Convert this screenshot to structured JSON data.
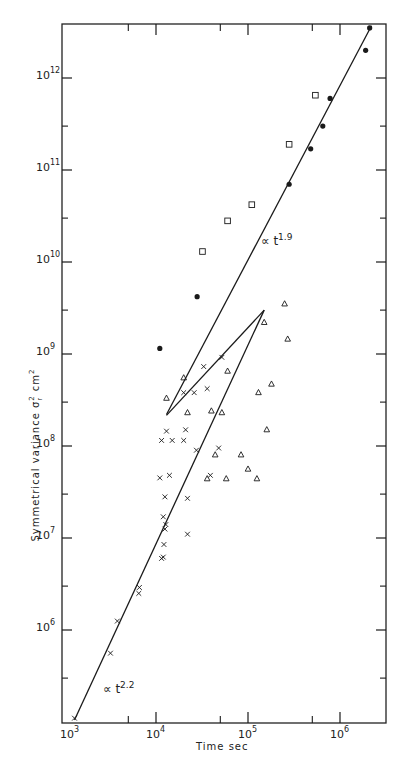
{
  "chart_data": {
    "type": "scatter",
    "scale": {
      "x": "log",
      "y": "log"
    },
    "title": "",
    "xlabel": "Time  sec",
    "ylabel": "Symmetrical  variance  σr² cm²",
    "ylabel_parts": {
      "text": "Symmetrical  variance  σ",
      "sub": "r",
      "sup": "2",
      "unit": " cm",
      "unit_sup": "2"
    },
    "xlim": [
      1000,
      3200000
    ],
    "ylim": [
      100000,
      3900000000000
    ],
    "grid": false,
    "legend": null,
    "x_ticks": [
      {
        "value": 1000,
        "label_base": "10",
        "label_exp": "3"
      },
      {
        "value": 10000,
        "label_base": "10",
        "label_exp": "4"
      },
      {
        "value": 100000,
        "label_base": "10",
        "label_exp": "5"
      },
      {
        "value": 1000000,
        "label_base": "10",
        "label_exp": "6"
      }
    ],
    "x_minor_ticks": [
      5000,
      50000,
      500000
    ],
    "y_ticks": [
      {
        "value": 1000000,
        "label_base": "10",
        "label_exp": "6"
      },
      {
        "value": 10000000,
        "label_base": "10",
        "label_exp": "7"
      },
      {
        "value": 100000000,
        "label_base": "10",
        "label_exp": "8"
      },
      {
        "value": 1000000000,
        "label_base": "10",
        "label_exp": "9"
      },
      {
        "value": 10000000000,
        "label_base": "10",
        "label_exp": "10"
      },
      {
        "value": 100000000000,
        "label_base": "10",
        "label_exp": "11"
      },
      {
        "value": 1000000000000,
        "label_base": "10",
        "label_exp": "12"
      }
    ],
    "y_minor_ticks": [
      300000,
      3000000,
      30000000,
      300000000,
      3000000000,
      30000000000,
      300000000000
    ],
    "series": [
      {
        "name": "filled circles",
        "marker": "filled-circle",
        "points": [
          [
            11000,
            1150000000
          ],
          [
            28000,
            4200000000
          ],
          [
            280000,
            70000000000
          ],
          [
            480000,
            170000000000
          ],
          [
            650000,
            300000000000
          ],
          [
            780000,
            600000000000
          ],
          [
            1900000,
            2000000000000
          ],
          [
            2100000,
            3500000000000
          ]
        ]
      },
      {
        "name": "open squares",
        "marker": "open-square",
        "points": [
          [
            32000,
            13000000000
          ],
          [
            60000,
            28000000000
          ],
          [
            110000,
            42000000000
          ],
          [
            280000,
            190000000000
          ],
          [
            540000,
            650000000000
          ]
        ]
      },
      {
        "name": "triangles",
        "marker": "open-triangle",
        "points": [
          [
            13000,
            330000000
          ],
          [
            20000,
            550000000
          ],
          [
            40000,
            240000000
          ],
          [
            60000,
            650000000
          ],
          [
            44000,
            80000000
          ],
          [
            36000,
            44000000
          ],
          [
            58000,
            44000000
          ],
          [
            84000,
            80000000
          ],
          [
            100000,
            56000000
          ],
          [
            125000,
            44000000
          ],
          [
            160000,
            150000000
          ],
          [
            130000,
            380000000
          ],
          [
            180000,
            470000000
          ],
          [
            150000,
            2200000000
          ],
          [
            250000,
            3500000000
          ],
          [
            270000,
            1450000000
          ],
          [
            22000,
            230000000
          ],
          [
            52000,
            230000000
          ]
        ]
      },
      {
        "name": "crosses",
        "marker": "cross",
        "points": [
          [
            1300,
            110000
          ],
          [
            3200,
            560000
          ],
          [
            3800,
            1250000
          ],
          [
            6500,
            2500000
          ],
          [
            6600,
            2900000
          ],
          [
            11500,
            6000000
          ],
          [
            12000,
            6200000
          ],
          [
            12200,
            8500000
          ],
          [
            12500,
            12500000
          ],
          [
            12800,
            14000000
          ],
          [
            12000,
            17000000
          ],
          [
            22000,
            11000000
          ],
          [
            11000,
            45000000
          ],
          [
            14000,
            48000000
          ],
          [
            12500,
            28000000
          ],
          [
            22000,
            27000000
          ],
          [
            11500,
            115000000
          ],
          [
            13000,
            145000000
          ],
          [
            15000,
            115000000
          ],
          [
            20000,
            115000000
          ],
          [
            21000,
            150000000
          ],
          [
            26000,
            380000000
          ],
          [
            20000,
            380000000
          ],
          [
            33000,
            730000000
          ],
          [
            36000,
            420000000
          ],
          [
            27500,
            90000000
          ],
          [
            48000,
            95000000
          ],
          [
            39000,
            48000000
          ],
          [
            52000,
            920000000
          ]
        ]
      }
    ],
    "fit_lines": [
      {
        "label_prefix": "∝ t",
        "exponent": "1.9",
        "from": [
          13000,
          220000000
        ],
        "to": [
          2200000,
          3700000000000
        ],
        "label_pos": [
          150000,
          17000000000
        ]
      },
      {
        "label_prefix": "∝ t",
        "exponent": "2.2",
        "from": [
          1300,
          105000
        ],
        "to": [
          150000,
          3000000000
        ],
        "label_pos": [
          1800,
          240000
        ]
      },
      {
        "label_prefix": "",
        "exponent": "",
        "from": [
          13000,
          215000000
        ],
        "to": [
          150000,
          3000000000
        ],
        "label_pos": null
      }
    ],
    "annotations": [
      {
        "text": "∝ t",
        "sup": "1.9"
      },
      {
        "text": "∝ t",
        "sup": "2.2"
      }
    ]
  },
  "axes": {
    "x_title": "Time  sec",
    "y_title_main": "Symmetrical  variance  σ",
    "y_title_sub": "r",
    "y_title_sup": "2",
    "y_title_unit": " cm",
    "y_title_unit_sup": "2"
  },
  "plot_frame": {
    "left": 62,
    "top": 24,
    "right": 386,
    "bottom": 723,
    "stroke": "#222222"
  },
  "ink_color": "#1a1a1a"
}
